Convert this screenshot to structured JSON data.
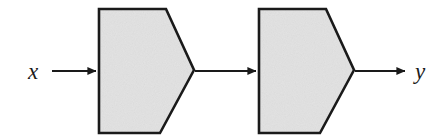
{
  "figure": {
    "kind": "block-diagram",
    "background_color": "#ffffff",
    "stroke_color": "#1a1a1a",
    "block_fill_color": "#e2e2e2",
    "label_color": "#1a1a1a",
    "input_label": "x",
    "output_label": "y",
    "blocks": [
      {
        "id": "block-1",
        "shape": "pentagon-right-point",
        "label": "",
        "fill": "#e2e2e2",
        "stroke": "#1a1a1a",
        "x": 98,
        "y": 8,
        "width": 97,
        "height": 126
      },
      {
        "id": "block-2",
        "shape": "pentagon-right-point",
        "label": "",
        "fill": "#e2e2e2",
        "stroke": "#1a1a1a",
        "x": 258,
        "y": 8,
        "width": 97,
        "height": 126
      }
    ],
    "arrows": [
      {
        "id": "arrow-input",
        "label": "x",
        "from_x": 52,
        "to_x": 98,
        "y": 71
      },
      {
        "id": "arrow-middle",
        "label": "",
        "from_x": 195,
        "to_x": 258,
        "y": 71
      },
      {
        "id": "arrow-output",
        "label": "y",
        "from_x": 355,
        "to_x": 407,
        "y": 71
      }
    ]
  }
}
